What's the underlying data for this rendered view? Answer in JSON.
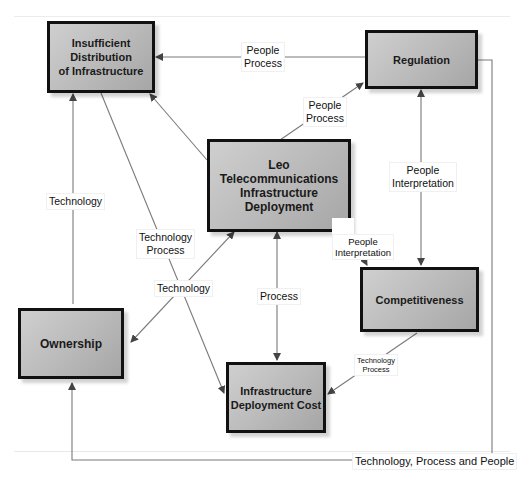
{
  "diagram": {
    "title": "",
    "nodes": [
      {
        "id": "insufficient",
        "label": "Insufficient Distribution\nof Infrastructure"
      },
      {
        "id": "regulation",
        "label": "Regulation"
      },
      {
        "id": "leo",
        "label": "Leo Telecommunications\nInfrastructure Deployment"
      },
      {
        "id": "competitiveness",
        "label": "Competitiveness"
      },
      {
        "id": "ownership",
        "label": "Ownership"
      },
      {
        "id": "cost",
        "label": "Infrastructure\nDeployment Cost"
      }
    ],
    "edges": [
      {
        "from": "regulation",
        "to": "insufficient",
        "label": "People\nProcess"
      },
      {
        "from": "leo",
        "to": "regulation",
        "label": "People\nProcess"
      },
      {
        "from": "leo",
        "to": "insufficient",
        "label": ""
      },
      {
        "from": "regulation",
        "to": "competitiveness",
        "label": "People\nInterpretation",
        "bidirectional": true
      },
      {
        "from": "leo",
        "to": "competitiveness",
        "label": "People\nInterpretation"
      },
      {
        "from": "ownership",
        "to": "insufficient",
        "label": "Technology"
      },
      {
        "from": "insufficient",
        "to": "cost",
        "label": "Technology\nProcess"
      },
      {
        "from": "leo",
        "to": "ownership",
        "label": "Technology",
        "bidirectional": true
      },
      {
        "from": "leo",
        "to": "cost",
        "label": "Process",
        "bidirectional": true
      },
      {
        "from": "competitiveness",
        "to": "cost",
        "label": "Technology\nProcess"
      },
      {
        "from": "regulation",
        "to": "ownership",
        "label": "Technology, Process and People"
      }
    ]
  }
}
